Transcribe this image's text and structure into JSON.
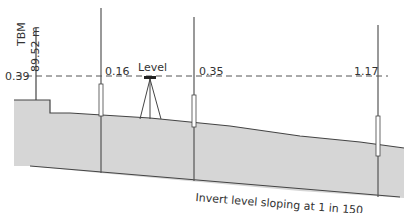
{
  "diagram": {
    "tbm_label": "TBM",
    "tbm_value": "89.52 m",
    "readings": [
      "0.39",
      "0.16",
      "0.35",
      "1.17"
    ],
    "instrument_label": "Level",
    "invert_label": "Invert level sloping at 1 in 150",
    "colors": {
      "ground": "#d4d4d4",
      "line": "#444444",
      "dash": "#555555"
    }
  }
}
